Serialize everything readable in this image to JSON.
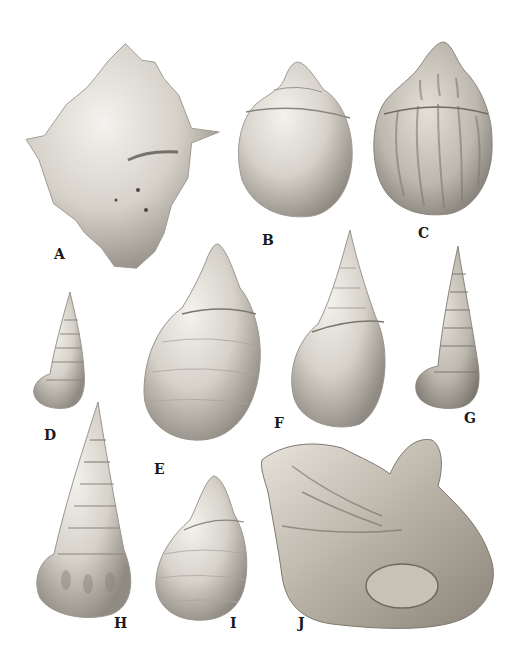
{
  "plate": {
    "background": "#ffffff",
    "shell_tone": "#d8d4cc",
    "shadow_tone": "#8a867e",
    "label_color": "#1a1a1a"
  },
  "specimens": [
    {
      "id": "A",
      "label": "A",
      "form": "spiny-knobbed-shell"
    },
    {
      "id": "B",
      "label": "B",
      "form": "globose-shell"
    },
    {
      "id": "C",
      "label": "C",
      "form": "ribbed-globose-shell"
    },
    {
      "id": "D",
      "label": "D",
      "form": "small-turreted-shell"
    },
    {
      "id": "E",
      "label": "E",
      "form": "ovate-spired-shell"
    },
    {
      "id": "F",
      "label": "F",
      "form": "ovate-conical-shell"
    },
    {
      "id": "G",
      "label": "G",
      "form": "turreted-ribbed-shell"
    },
    {
      "id": "H",
      "label": "H",
      "form": "tall-turreted-shell"
    },
    {
      "id": "I",
      "label": "I",
      "form": "small-ovate-shell"
    },
    {
      "id": "J",
      "label": "J",
      "form": "irregular-oyster-fragment"
    }
  ]
}
